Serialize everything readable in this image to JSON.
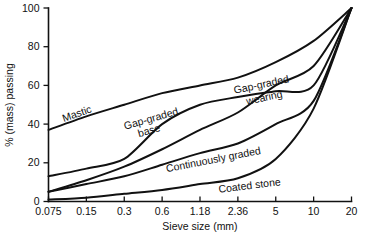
{
  "chart_data": {
    "type": "line",
    "title": "",
    "subtitle": "",
    "xlabel": "Sieve size (mm)",
    "ylabel": "% (mass) passing",
    "categories": [
      "0.075",
      "0.15",
      "0.3",
      "0.6",
      "1.18",
      "2.36",
      "5",
      "10",
      "20"
    ],
    "x_tick_labels": [
      "0.075",
      "0.15",
      "0.3",
      "0.6",
      "1.18",
      "2.36",
      "5",
      "10",
      "20"
    ],
    "y_tick_labels": [
      "0",
      "20",
      "40",
      "60",
      "80",
      "100"
    ],
    "y_ticks": [
      0,
      20,
      40,
      60,
      80,
      100
    ],
    "ylim": [
      0,
      100
    ],
    "xlim_index": [
      0,
      8
    ],
    "x_scale": "categorical-sieve (evenly spaced)",
    "grid": false,
    "legend": "inline curve labels",
    "legend_position": "inline",
    "series": [
      {
        "name": "Mastic",
        "label": "Mastic",
        "values": [
          37,
          44,
          50,
          56,
          60,
          64,
          72,
          83,
          100
        ]
      },
      {
        "name": "Gap-graded wearing",
        "label": "Gap-graded wearing",
        "values": [
          5,
          11,
          18,
          27,
          37,
          46,
          60,
          70,
          100
        ]
      },
      {
        "name": "Gap-graded base",
        "label": "Gap-graded base",
        "values": [
          13,
          17,
          22,
          40,
          50,
          54,
          57,
          60,
          100
        ]
      },
      {
        "name": "Continuously graded",
        "label": "Continuously graded",
        "values": [
          5,
          9,
          13,
          19,
          25,
          30,
          40,
          52,
          100
        ]
      },
      {
        "name": "Coated stone",
        "label": "Coated stone",
        "values": [
          1,
          2,
          4,
          6,
          9,
          12,
          22,
          48,
          100
        ]
      }
    ],
    "curve_labels": [
      {
        "text": "Mastic",
        "x": 78,
        "y": 117,
        "rotate": -19
      },
      {
        "text": "Gap-graded",
        "x": 152,
        "y": 122,
        "rotate": -16
      },
      {
        "text": "base",
        "x": 150,
        "y": 134,
        "rotate": -16
      },
      {
        "text": "Gap-graded",
        "x": 262,
        "y": 88,
        "rotate": -12
      },
      {
        "text": "wearing",
        "x": 265,
        "y": 101,
        "rotate": -12
      },
      {
        "text": "Continuously graded",
        "x": 214,
        "y": 163,
        "rotate": -11
      },
      {
        "text": "Coated stone",
        "x": 250,
        "y": 189,
        "rotate": -7
      }
    ]
  },
  "colors": {
    "background": "#ffffff",
    "ink": "#111111",
    "curve": "#111111"
  }
}
